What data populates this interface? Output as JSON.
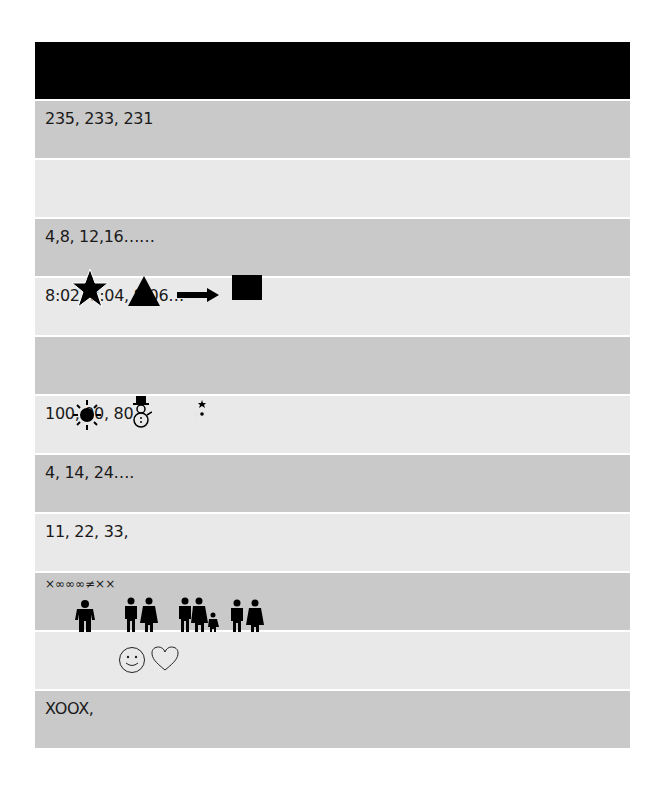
{
  "table": {
    "header": "",
    "rows": [
      {
        "text": "235, 233, 231",
        "shade": "dark"
      },
      {
        "text": "",
        "shade": "light"
      },
      {
        "text": "4,8, 12,16……",
        "shade": "dark"
      },
      {
        "text": "8:02, 8:04, 8:06…",
        "shade": "light",
        "icons": [
          "star-icon",
          "triangle-icon",
          "arrow-right-icon",
          "square-icon"
        ]
      },
      {
        "text": "",
        "shade": "dark"
      },
      {
        "text": "100, 90, 80",
        "shade": "light",
        "icons": [
          "sun-icon",
          "snowman-icon",
          "moon-stars-icon"
        ]
      },
      {
        "text": "4, 14, 24….",
        "shade": "dark"
      },
      {
        "text": "11, 22, 33,",
        "shade": "light"
      },
      {
        "text": "×∞∞∞≠××",
        "shade": "dark",
        "icons": [
          "man-icon",
          "couple-icon",
          "family-icon",
          "couple-icon"
        ]
      },
      {
        "text": "",
        "shade": "light",
        "icons": [
          "smiley-icon",
          "heart-icon"
        ]
      },
      {
        "text": "XOOX,",
        "shade": "dark"
      }
    ]
  },
  "colors": {
    "header": "#000000",
    "row_dark": "#c9c9c9",
    "row_light": "#e9e9e9",
    "text": "#1a1a1a"
  }
}
